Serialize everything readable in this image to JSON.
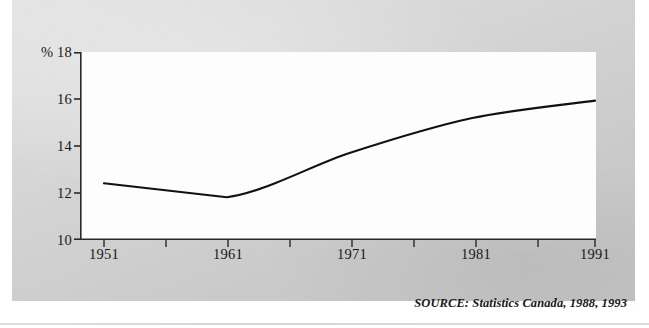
{
  "figure": {
    "source_note": "SOURCE: Statistics Canada, 1988, 1993",
    "unit_symbol": "%",
    "panel_background": "#d6d6d6",
    "plot_background": "#fdfdfd",
    "line_color": "#111114",
    "axis_color": "#2a2a2e"
  },
  "chart_data": {
    "type": "line",
    "title": "",
    "subtitle": "",
    "xlabel": "",
    "ylabel": "%",
    "x": [
      1951,
      1961,
      1971,
      1981,
      1991
    ],
    "values": [
      12.4,
      11.8,
      13.7,
      15.2,
      15.95
    ],
    "series": [
      {
        "name": "Percent",
        "values": [
          12.4,
          11.8,
          13.7,
          15.2,
          15.95
        ]
      }
    ],
    "xlim": [
      1951,
      1991
    ],
    "ylim": [
      10,
      18
    ],
    "y_ticks": [
      10,
      12,
      14,
      16,
      18
    ],
    "y_tick_labels": [
      "10",
      "12",
      "14",
      "16",
      "18"
    ],
    "x_ticks": [
      1951,
      1961,
      1971,
      1981,
      1991
    ],
    "x_tick_labels": [
      "1951",
      "1961",
      "1971",
      "1981",
      "1991"
    ],
    "x_minor_ticks": [
      1956,
      1966,
      1976,
      1986
    ],
    "grid": false,
    "legend": false,
    "legend_position": "none",
    "annotations": [
      "SOURCE: Statistics Canada, 1988, 1993"
    ]
  }
}
